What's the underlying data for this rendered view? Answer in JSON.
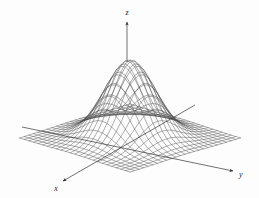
{
  "figure": {
    "type": "3d-surface-wireframe",
    "background_color": "#fdfdfd",
    "mesh_color": "#4a4a4a",
    "axis_color": "#333333"
  },
  "axes": {
    "x": {
      "label": "x",
      "arrow": "arrowhead-down-left",
      "name": "x-axis"
    },
    "y": {
      "label": "y",
      "arrow": "arrowhead-right",
      "name": "y-axis"
    },
    "z": {
      "label": "z",
      "arrow": "arrowhead-up",
      "name": "z-axis"
    }
  },
  "chart_data": {
    "type": "surface",
    "title": "",
    "xlabel": "x",
    "ylabel": "y",
    "zlabel": "z",
    "function": "gaussian bivariate normal bell surface",
    "formula": "z = exp(-(u^2 + v^2)/2)",
    "grid": true,
    "legend": "none",
    "xlim": [
      -3,
      3
    ],
    "ylim": [
      -3,
      3
    ],
    "zlim": [
      0,
      1
    ],
    "grid_steps_u": 24,
    "grid_steps_v": 24,
    "peak": {
      "x": 0,
      "y": 0,
      "z": 1
    },
    "projection": {
      "kind": "oblique-isometric",
      "origin_px": [
        130,
        138
      ],
      "u_axis_px": [
        -4.6,
        1.42
      ],
      "v_axis_px": [
        4.6,
        1.42
      ],
      "z_scale_px": 78
    }
  }
}
